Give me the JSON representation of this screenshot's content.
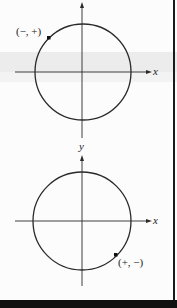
{
  "figure": {
    "top_diagram": {
      "x_axis_label": "x",
      "y_axis_label": "y",
      "point_label": "(−, +)",
      "point_quadrant": "II"
    },
    "bottom_diagram": {
      "x_axis_label": "x",
      "y_axis_label": "y",
      "point_label": "(+, −)",
      "point_quadrant": "IV"
    }
  },
  "colors": {
    "stroke": "#2a2a2a",
    "background": "#fcfcfc",
    "band": "#ececec",
    "bottom_bar": "#111111"
  }
}
